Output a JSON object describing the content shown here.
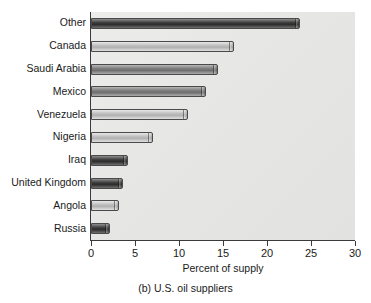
{
  "chart_data": {
    "type": "bar",
    "orientation": "horizontal",
    "title": "",
    "caption": "(b) U.S. oil suppliers",
    "xlabel": "Percent of supply",
    "ylabel": "",
    "xlim": [
      0,
      30
    ],
    "xticks": [
      0,
      5,
      10,
      15,
      20,
      25,
      30
    ],
    "xtick_labels": [
      "0",
      "5",
      "10",
      "15",
      "20",
      "25",
      "30"
    ],
    "grid": false,
    "legend": false,
    "categories": [
      "Other",
      "Canada",
      "Saudi Arabia",
      "Mexico",
      "Venezuela",
      "Nigeria",
      "Iraq",
      "United Kingdom",
      "Angola",
      "Russia"
    ],
    "values": [
      23.8,
      16.3,
      14.4,
      13.1,
      11.0,
      7.0,
      4.2,
      3.6,
      3.2,
      2.2
    ],
    "bar_styles": [
      "dark",
      "light",
      "mid",
      "mid",
      "light",
      "light",
      "dark",
      "dark",
      "light",
      "dark"
    ]
  },
  "colors": {
    "plot_background": "#e6e6e5",
    "axis": "#3a3a3a",
    "text": "#1a1a1a",
    "bar_dark": "#2c2c2c",
    "bar_mid": "#7b7b7b",
    "bar_light": "#bcbcbc"
  }
}
